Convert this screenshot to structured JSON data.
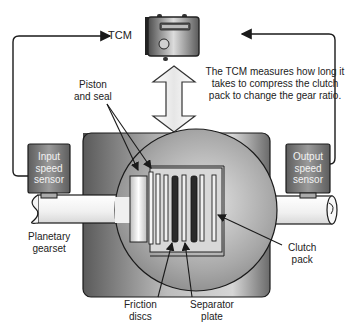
{
  "diagram": {
    "colors": {
      "housing_dark": "#4a4a4a",
      "housing_light": "#bdbdbd",
      "shaft": "#f4f4f4",
      "sensor_body": "#7a7a7a",
      "line": "#1a1a1a",
      "friction_disc": "#2a2a2a"
    },
    "nodes": {
      "tcm": {
        "label": "TCM",
        "icon": "tcm-module-icon"
      },
      "input_sensor": {
        "label_lines": [
          "Input",
          "speed",
          "sensor"
        ]
      },
      "output_sensor": {
        "label_lines": [
          "Output",
          "speed",
          "sensor"
        ]
      }
    },
    "note": "The TCM measures how long it takes to compress the clutch pack to change the gear ratio.",
    "callouts": {
      "piston_seal": [
        "Piston",
        "and seal"
      ],
      "planetary": [
        "Planetary",
        "gearset"
      ],
      "clutch_pack": [
        "Clutch",
        "pack"
      ],
      "friction_discs": [
        "Friction",
        "discs"
      ],
      "separator_plate": [
        "Separator",
        "plate"
      ]
    },
    "edges": [
      {
        "from": "input_sensor",
        "to": "tcm",
        "type": "arrow"
      },
      {
        "from": "output_sensor",
        "to": "tcm",
        "type": "arrow"
      },
      {
        "from": "tcm",
        "to": "clutch_housing",
        "type": "double-arrow"
      }
    ]
  }
}
